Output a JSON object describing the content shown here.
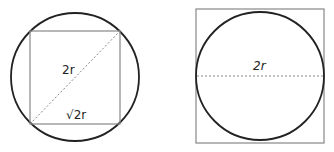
{
  "figure_left": {
    "description": "Square inscribed in a circle",
    "diagonal_label": "2r",
    "side_label": "√2r",
    "colors": {
      "circle": "#222222",
      "square": "#888888",
      "diagonal": "#888888"
    }
  },
  "figure_right": {
    "description": "Circle inscribed in a square",
    "diameter_label": "2r",
    "colors": {
      "circle": "#222222",
      "square": "#888888",
      "diameter": "#888888"
    }
  }
}
